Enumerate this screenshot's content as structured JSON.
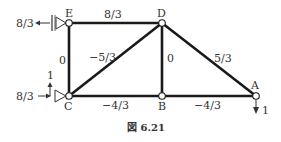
{
  "diagram": {
    "type": "truss",
    "caption": "図 6.21",
    "nodes": [
      {
        "id": "E",
        "label": "E",
        "x": 69,
        "y": 23
      },
      {
        "id": "D",
        "label": "D",
        "x": 162,
        "y": 23
      },
      {
        "id": "C",
        "label": "C",
        "x": 69,
        "y": 96
      },
      {
        "id": "B",
        "label": "B",
        "x": 162,
        "y": 96
      },
      {
        "id": "A",
        "label": "A",
        "x": 256,
        "y": 96
      }
    ],
    "members": [
      {
        "from": "E",
        "to": "D",
        "force": "8/3"
      },
      {
        "from": "E",
        "to": "C",
        "force": "0"
      },
      {
        "from": "C",
        "to": "D",
        "force": "−5/3"
      },
      {
        "from": "D",
        "to": "B",
        "force": "0"
      },
      {
        "from": "D",
        "to": "A",
        "force": "5/3"
      },
      {
        "from": "C",
        "to": "B",
        "force": "−4/3"
      },
      {
        "from": "B",
        "to": "A",
        "force": "−4/3"
      }
    ],
    "supports": [
      {
        "node": "E",
        "type": "pin-wall",
        "reaction_label": "8/3",
        "reaction_direction": "left"
      },
      {
        "node": "C",
        "type": "roller",
        "reaction_labels": {
          "horizontal": "8/3",
          "vertical": "1"
        }
      }
    ],
    "loads": [
      {
        "node": "A",
        "label": "1",
        "direction": "down"
      }
    ],
    "labels": {
      "node_E": "E",
      "node_D": "D",
      "node_C": "C",
      "node_B": "B",
      "node_A": "A",
      "member_ED": "8/3",
      "member_EC": "0",
      "member_CD": "−5/3",
      "member_DB": "0",
      "member_DA": "5/3",
      "member_CB": "−4/3",
      "member_BA": "−4/3",
      "reaction_E": "8/3",
      "reaction_C_h": "8/3",
      "reaction_C_v": "1",
      "load_A": "1"
    },
    "colors": {
      "member": "#1a1a1a",
      "text": "#333333",
      "background": "#ffffff"
    }
  }
}
